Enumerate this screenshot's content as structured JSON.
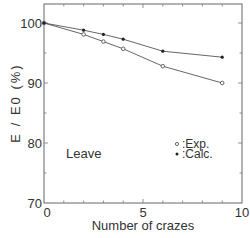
{
  "chart_data": {
    "type": "line",
    "title": "",
    "xlabel": "Number of crazes",
    "ylabel": "E / E0 (%)",
    "xlim": [
      0,
      10
    ],
    "ylim": [
      70,
      103.3
    ],
    "x_ticks": [
      0,
      5,
      10
    ],
    "x_tick_labels": [
      "0",
      "5",
      "10"
    ],
    "y_ticks": [
      70,
      80,
      90,
      100
    ],
    "y_tick_labels": [
      "70",
      "80",
      "90",
      "100"
    ],
    "grid": false,
    "annotation": "Leave",
    "legend": {
      "position": "lower-right-inside",
      "entries": [
        ":Exp.",
        ":Calc."
      ]
    },
    "series": [
      {
        "name": "Exp.",
        "marker": "open-circle",
        "x": [
          0,
          2,
          3,
          4,
          6,
          9
        ],
        "values": [
          100,
          98.1,
          96.9,
          95.7,
          92.8,
          90.0
        ]
      },
      {
        "name": "Calc.",
        "marker": "filled-circle",
        "x": [
          0,
          2,
          3,
          4,
          6,
          9
        ],
        "values": [
          100,
          98.8,
          98.1,
          97.3,
          95.3,
          94.3
        ]
      }
    ]
  }
}
